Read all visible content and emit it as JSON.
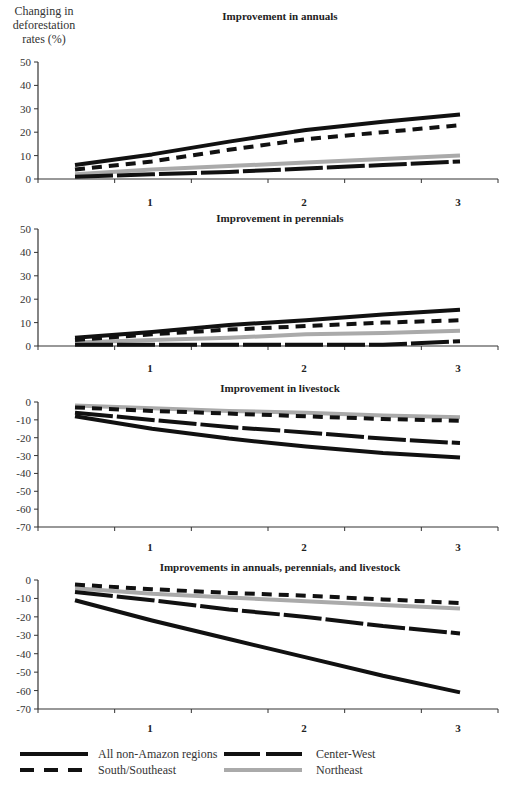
{
  "y_axis_label": "Changing in deforestation rates (%)",
  "x_tick_labels": [
    "1",
    "2",
    "3"
  ],
  "legend": [
    {
      "name": "All non-Amazon regions",
      "style": "solid",
      "color": "#111111"
    },
    {
      "name": "South/Southeast",
      "style": "short-dash",
      "color": "#111111"
    },
    {
      "name": "Center-West",
      "style": "long-dash",
      "color": "#111111"
    },
    {
      "name": "Northeast",
      "style": "solid",
      "color": "#aaaaaa"
    }
  ],
  "chart_data": [
    {
      "type": "line",
      "title": "Improvement in annuals",
      "xlabel": "",
      "ylabel": "Changing in deforestation rates (%)",
      "categories": [
        "1",
        "2",
        "3"
      ],
      "x": [
        0.5,
        1,
        1.5,
        2,
        2.5,
        3
      ],
      "ylim": [
        0,
        50
      ],
      "yticks": [
        0,
        10,
        20,
        30,
        40,
        50
      ],
      "grid": false,
      "series": [
        {
          "name": "All non-Amazon regions",
          "values": [
            6,
            10.5,
            16,
            21,
            24.5,
            27.5
          ]
        },
        {
          "name": "South/Southeast",
          "values": [
            4,
            7.5,
            12.5,
            17,
            20,
            23
          ]
        },
        {
          "name": "Center-West",
          "values": [
            1,
            2,
            3,
            4.5,
            6,
            7.5
          ]
        },
        {
          "name": "Northeast",
          "values": [
            2,
            4,
            5.5,
            7,
            8.5,
            10
          ]
        }
      ]
    },
    {
      "type": "line",
      "title": "Improvement in perennials",
      "xlabel": "",
      "ylabel": "",
      "categories": [
        "1",
        "2",
        "3"
      ],
      "x": [
        0.5,
        1,
        1.5,
        2,
        2.5,
        3
      ],
      "ylim": [
        0,
        50
      ],
      "yticks": [
        0,
        10,
        20,
        30,
        40,
        50
      ],
      "grid": false,
      "series": [
        {
          "name": "All non-Amazon regions",
          "values": [
            3.5,
            6,
            9,
            11,
            13.5,
            15.5
          ]
        },
        {
          "name": "South/Southeast",
          "values": [
            2.5,
            5,
            7,
            8.5,
            10,
            11
          ]
        },
        {
          "name": "Center-West",
          "values": [
            0.5,
            0.5,
            0.5,
            0.5,
            0.5,
            2
          ]
        },
        {
          "name": "Northeast",
          "values": [
            1.5,
            2.5,
            3.5,
            5,
            5.5,
            6.5
          ]
        }
      ]
    },
    {
      "type": "line",
      "title": "Improvement in livestock",
      "xlabel": "",
      "ylabel": "",
      "categories": [
        "1",
        "2",
        "3"
      ],
      "x": [
        0.5,
        1,
        1.5,
        2,
        2.5,
        3
      ],
      "ylim": [
        -70,
        0
      ],
      "yticks": [
        0,
        -10,
        -20,
        -30,
        -40,
        -50,
        -60,
        -70
      ],
      "grid": false,
      "series": [
        {
          "name": "All non-Amazon regions",
          "values": [
            -8,
            -15,
            -20.5,
            -25,
            -28.5,
            -31
          ]
        },
        {
          "name": "South/Southeast",
          "values": [
            -3,
            -5,
            -6.5,
            -8,
            -9.5,
            -10.5
          ]
        },
        {
          "name": "Center-West",
          "values": [
            -6,
            -10,
            -14,
            -17,
            -20.5,
            -23
          ]
        },
        {
          "name": "Northeast",
          "values": [
            -2,
            -3.5,
            -5,
            -6,
            -7.5,
            -8.5
          ]
        }
      ]
    },
    {
      "type": "line",
      "title": "Improvements in annuals, perennials, and livestock",
      "xlabel": "",
      "ylabel": "",
      "categories": [
        "1",
        "2",
        "3"
      ],
      "x": [
        0.5,
        1,
        1.5,
        2,
        2.5,
        3
      ],
      "ylim": [
        -70,
        0
      ],
      "yticks": [
        0,
        -10,
        -20,
        -30,
        -40,
        -50,
        -60,
        -70
      ],
      "grid": false,
      "series": [
        {
          "name": "All non-Amazon regions",
          "values": [
            -11,
            -22,
            -32,
            -42,
            -52,
            -61
          ]
        },
        {
          "name": "South/Southeast",
          "values": [
            -2.5,
            -5,
            -7,
            -8.5,
            -10.5,
            -12.5
          ]
        },
        {
          "name": "Center-West",
          "values": [
            -6.5,
            -11,
            -16,
            -20,
            -25,
            -29
          ]
        },
        {
          "name": "Northeast",
          "values": [
            -4.5,
            -7.5,
            -9.5,
            -11.5,
            -13.5,
            -15.5
          ]
        }
      ]
    }
  ]
}
